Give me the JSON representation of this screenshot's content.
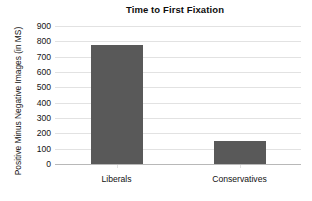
{
  "chart_data": {
    "type": "bar",
    "title": "Time to First Fixation",
    "xlabel": "",
    "ylabel": "Positive Minus Negative Images (in MS)",
    "categories": [
      "Liberals",
      "Conservatives"
    ],
    "values": [
      775,
      150
    ],
    "series": [
      {
        "name": "Positive Minus Negative Images (in MS)",
        "values": [
          775,
          150
        ]
      }
    ],
    "ylim": [
      0,
      900
    ],
    "y_ticks": [
      900,
      800,
      700,
      600,
      500,
      400,
      300,
      200,
      100,
      0
    ],
    "y_tick_labels": [
      "900",
      "800",
      "700",
      "600",
      "500",
      "400",
      "300",
      "200",
      "100",
      "0"
    ],
    "grid": "horizontal",
    "legend": "none",
    "bar_color": "#595959",
    "grid_color": "#e2e2e2",
    "axis_color": "#b8b8b8",
    "background": "#ffffff"
  },
  "caption_fragment": ""
}
